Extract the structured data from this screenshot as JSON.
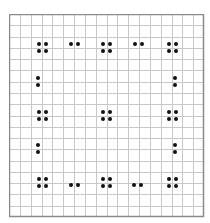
{
  "diagram": {
    "kind": "dot-pattern-on-grid",
    "grid": {
      "left": 9,
      "top": 14,
      "width": 195,
      "height": 203,
      "columns": 18,
      "rows": 18,
      "line_color": "#c8c8c8",
      "border_color": "#8a8a8a",
      "background": "#ffffff"
    },
    "dot_color": "#111111",
    "dot_size": 4,
    "dot_spacing": 7,
    "groups": [
      {
        "id": "top-left",
        "type": "quad",
        "cx": 42,
        "cy": 47
      },
      {
        "id": "top-mid-left",
        "type": "pair-h",
        "cx": 74,
        "cy": 44
      },
      {
        "id": "top-center",
        "type": "quad",
        "cx": 106,
        "cy": 47
      },
      {
        "id": "top-mid-right",
        "type": "pair-h",
        "cx": 138,
        "cy": 44
      },
      {
        "id": "top-right",
        "type": "quad",
        "cx": 172,
        "cy": 47
      },
      {
        "id": "left-upper",
        "type": "pair-v",
        "cx": 38,
        "cy": 81
      },
      {
        "id": "right-upper",
        "type": "pair-v",
        "cx": 175,
        "cy": 81
      },
      {
        "id": "mid-left",
        "type": "quad",
        "cx": 42,
        "cy": 115
      },
      {
        "id": "center",
        "type": "quad",
        "cx": 106,
        "cy": 115
      },
      {
        "id": "mid-right",
        "type": "quad",
        "cx": 172,
        "cy": 115
      },
      {
        "id": "left-lower",
        "type": "pair-v",
        "cx": 38,
        "cy": 148
      },
      {
        "id": "right-lower",
        "type": "pair-v",
        "cx": 175,
        "cy": 148
      },
      {
        "id": "bottom-left",
        "type": "quad",
        "cx": 42,
        "cy": 182
      },
      {
        "id": "bottom-mid-left",
        "type": "pair-h",
        "cx": 74,
        "cy": 185
      },
      {
        "id": "bottom-center",
        "type": "quad",
        "cx": 106,
        "cy": 182
      },
      {
        "id": "bottom-mid-right",
        "type": "pair-h",
        "cx": 137,
        "cy": 185
      },
      {
        "id": "bottom-right",
        "type": "quad",
        "cx": 172,
        "cy": 182
      }
    ]
  }
}
